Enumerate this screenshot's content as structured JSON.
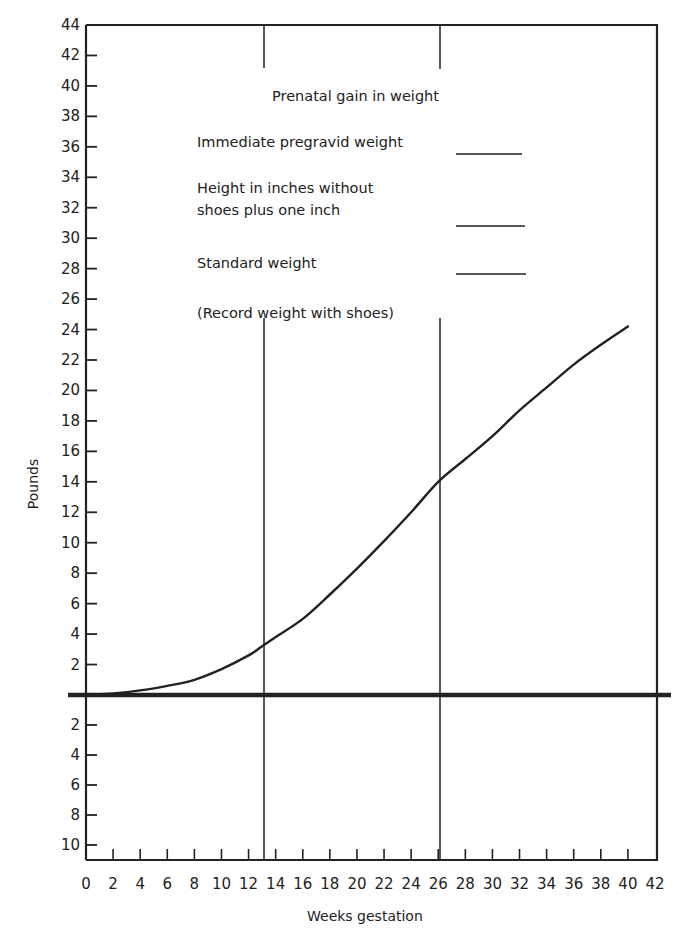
{
  "chart_data": {
    "type": "line",
    "title": "Prenatal gain in weight",
    "xlabel": "Weeks gestation",
    "ylabel": "Pounds",
    "xlim": [
      0,
      42
    ],
    "ylim": [
      -11,
      44
    ],
    "grid": false,
    "x_ticks": [
      0,
      2,
      4,
      6,
      8,
      10,
      12,
      14,
      16,
      18,
      20,
      22,
      24,
      26,
      28,
      30,
      32,
      34,
      36,
      38,
      40,
      42
    ],
    "y_ticks_above": [
      2,
      4,
      6,
      8,
      10,
      12,
      14,
      16,
      18,
      20,
      22,
      24,
      26,
      28,
      30,
      32,
      34,
      36,
      38,
      40,
      42,
      44
    ],
    "y_ticks_below": [
      2,
      4,
      6,
      8,
      10
    ],
    "vertical_markers": [
      13,
      26
    ],
    "series": [
      {
        "name": "Prenatal weight gain",
        "x": [
          0,
          2,
          4,
          6,
          8,
          10,
          12,
          13,
          14,
          16,
          18,
          20,
          22,
          24,
          26,
          28,
          30,
          32,
          34,
          36,
          38,
          40
        ],
        "values": [
          0,
          0.1,
          0.3,
          0.6,
          1.0,
          1.7,
          2.6,
          3.2,
          3.8,
          5.0,
          6.6,
          8.3,
          10.1,
          12.0,
          14.0,
          15.5,
          17.0,
          18.7,
          20.2,
          21.7,
          23.0,
          24.2
        ]
      }
    ],
    "annotations": [
      "Immediate pregravid weight ______",
      "Height in inches without shoes plus one inch ______",
      "Standard weight ______",
      "(Record weight with shoes)"
    ]
  },
  "legend": {
    "title": "Prenatal gain in weight",
    "line1": "Immediate pregravid weight",
    "line2a": "Height in inches without",
    "line2b": "shoes plus one inch",
    "line3": "Standard weight",
    "line4": "(Record weight with shoes)"
  },
  "axes": {
    "xlabel": "Weeks gestation",
    "ylabel": "Pounds"
  },
  "colors": {
    "ink": "#222222",
    "background": "#ffffff"
  }
}
